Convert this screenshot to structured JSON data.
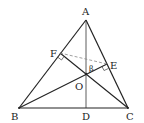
{
  "diagram": {
    "type": "geometry",
    "points": {
      "A": {
        "label": "A",
        "x": 86,
        "y": 20
      },
      "B": {
        "label": "B",
        "x": 19,
        "y": 108
      },
      "C": {
        "label": "C",
        "x": 128,
        "y": 108
      },
      "D": {
        "label": "D",
        "x": 86,
        "y": 108
      },
      "E": {
        "label": "E",
        "x": 107,
        "y": 64
      },
      "F": {
        "label": "F",
        "x": 60,
        "y": 53
      },
      "O": {
        "label": "O",
        "x": 86,
        "y": 74
      }
    },
    "angle_label": "β",
    "segments": [
      {
        "from": "A",
        "to": "B",
        "style": "solid"
      },
      {
        "from": "A",
        "to": "C",
        "style": "solid"
      },
      {
        "from": "B",
        "to": "C",
        "style": "solid"
      },
      {
        "from": "A",
        "to": "D",
        "style": "solid-thin"
      },
      {
        "from": "B",
        "to": "E",
        "style": "solid"
      },
      {
        "from": "C",
        "to": "F",
        "style": "solid"
      },
      {
        "from": "F",
        "to": "E",
        "style": "dashed"
      }
    ],
    "right_angle_marks": [
      "F",
      "E"
    ],
    "colors": {
      "line": "#222222",
      "dashed": "#888888",
      "background": "#ffffff"
    }
  }
}
